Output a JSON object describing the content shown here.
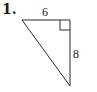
{
  "problem": {
    "number": "1."
  },
  "triangle": {
    "type": "right-triangle",
    "vertices": {
      "top_left": [
        22,
        20
      ],
      "right_angle": [
        70,
        20
      ],
      "bottom": [
        70,
        86
      ]
    },
    "legs": {
      "top": "6",
      "right": "8"
    },
    "right_angle_marker_size": 10,
    "stroke_color": "#2a2a2a"
  }
}
